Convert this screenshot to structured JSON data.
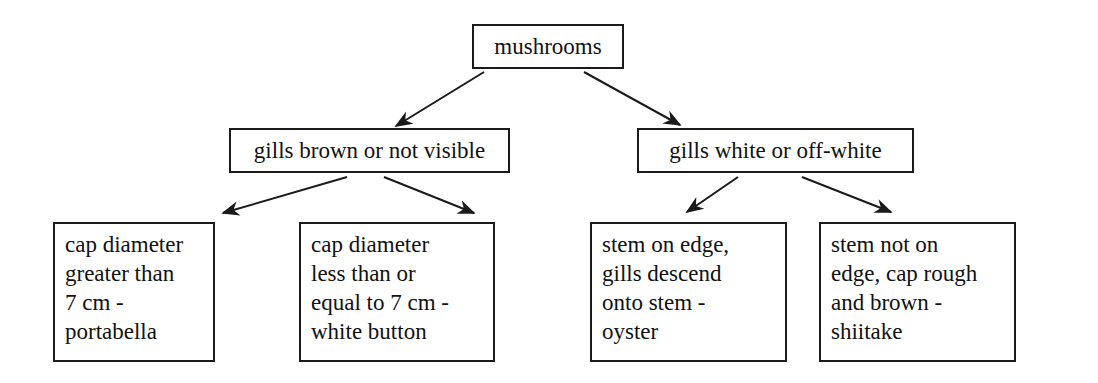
{
  "diagram": {
    "type": "decision-tree",
    "root": {
      "id": "root",
      "label": "mushrooms"
    },
    "level1": [
      {
        "id": "gills-brown",
        "label": "gills brown or not visible"
      },
      {
        "id": "gills-white",
        "label": "gills white or off-white"
      }
    ],
    "leaves": [
      {
        "id": "portabella",
        "parent": "gills-brown",
        "lines": [
          "cap diameter",
          "greater than",
          "7 cm -",
          "portabella"
        ]
      },
      {
        "id": "white-button",
        "parent": "gills-brown",
        "lines": [
          "cap diameter",
          "less than or",
          "equal to 7 cm -",
          "white button"
        ]
      },
      {
        "id": "oyster",
        "parent": "gills-white",
        "lines": [
          "stem on edge,",
          "gills descend",
          "onto stem -",
          "oyster"
        ]
      },
      {
        "id": "shiitake",
        "parent": "gills-white",
        "lines": [
          "stem not on",
          "edge, cap rough",
          "and brown -",
          "shiitake"
        ]
      }
    ],
    "edges": [
      {
        "from": "root",
        "to": "gills-brown"
      },
      {
        "from": "root",
        "to": "gills-white"
      },
      {
        "from": "gills-brown",
        "to": "portabella"
      },
      {
        "from": "gills-brown",
        "to": "white-button"
      },
      {
        "from": "gills-white",
        "to": "oyster"
      },
      {
        "from": "gills-white",
        "to": "shiitake"
      }
    ],
    "colors": {
      "stroke": "#1a1a1a",
      "background": "#ffffff",
      "text": "#111111"
    }
  }
}
